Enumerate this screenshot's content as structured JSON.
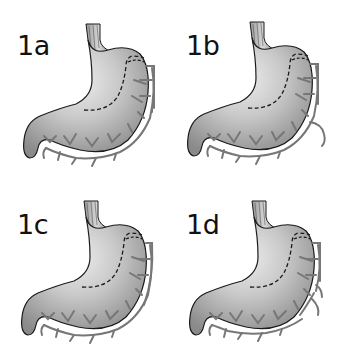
{
  "figure": {
    "colors": {
      "background": "#ffffff",
      "stomach_fill_light": "#e4e4e4",
      "stomach_fill_dark": "#8f8f8f",
      "outline": "#1a1a1a",
      "vessel": "#7a7a7a",
      "vessel_gap": "#ffffff",
      "label": "#111111"
    },
    "panels": [
      {
        "id": "1a",
        "label": "1a",
        "variant": "arcade-closed"
      },
      {
        "id": "1b",
        "label": "1b",
        "variant": "arcade-with-descending-branch"
      },
      {
        "id": "1c",
        "label": "1c",
        "variant": "arcade-continuous"
      },
      {
        "id": "1d",
        "label": "1d",
        "variant": "arcade-with-lateral-branch"
      }
    ]
  }
}
